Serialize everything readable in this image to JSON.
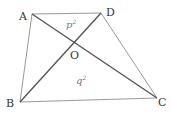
{
  "diagram": {
    "type": "quadrilateral-with-diagonals",
    "vertices": {
      "A": {
        "label": "A",
        "x": 32,
        "y": 14
      },
      "D": {
        "label": "D",
        "x": 101,
        "y": 13
      },
      "B": {
        "label": "B",
        "x": 20,
        "y": 102
      },
      "C": {
        "label": "C",
        "x": 157,
        "y": 98
      }
    },
    "intersection": {
      "label": "O",
      "x": 74,
      "y": 43
    },
    "region_labels": {
      "top": {
        "base": "p",
        "exp": "2"
      },
      "bottom": {
        "base": "q",
        "exp": "2"
      }
    },
    "colors": {
      "edges": "#9a9a9a",
      "diagonals": "#555555",
      "text": "#333333"
    }
  }
}
